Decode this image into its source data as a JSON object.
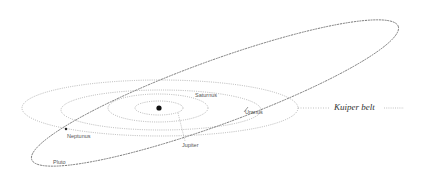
{
  "diagram": {
    "title": "",
    "sun": {
      "label": "",
      "x": 159,
      "y": 108
    },
    "planets": [
      {
        "name": "Jupiter",
        "label": "Jupiter",
        "label_x": 182,
        "label_y": 143
      },
      {
        "name": "Saturn",
        "label": "Saturnus",
        "label_x": 195,
        "label_y": 93
      },
      {
        "name": "Uranus",
        "label": "Uranus",
        "label_x": 245,
        "label_y": 110
      },
      {
        "name": "Neptune",
        "label": "Neptunus",
        "label_x": 67,
        "label_y": 134
      },
      {
        "name": "Pluto",
        "label": "Pluto",
        "label_x": 53,
        "label_y": 160
      }
    ],
    "region": {
      "label": "Kuiper belt",
      "x": 336,
      "y": 102
    },
    "colors": {
      "orbit": "#9a9a9a",
      "pluto_orbit": "#777777",
      "sun": "#111111",
      "text": "#555555"
    }
  }
}
